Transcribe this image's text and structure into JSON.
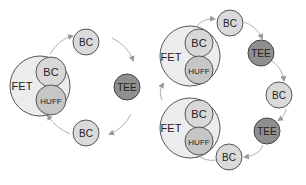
{
  "colors": {
    "big_fill": "#ebebeb",
    "inner_fill": "#d6d6d6",
    "tee_fill": "#8f8f8f",
    "stroke": "#555555",
    "arrow": "#aaaaaa"
  },
  "left_cycle": {
    "fet": {
      "label": "FET",
      "inner_top": "BC",
      "inner_bottom": "HUFF"
    },
    "top": "BC",
    "right": "TEE",
    "bottom": "BC"
  },
  "right_cycle": {
    "fet_top": {
      "label": "FET",
      "inner_top": "BC",
      "inner_bottom": "HUFF"
    },
    "fet_bottom": {
      "label": "FET",
      "inner_top": "BC",
      "inner_bottom": "HUFF"
    },
    "nodes": [
      "BC",
      "TEE",
      "BC",
      "TEE",
      "BC"
    ]
  }
}
